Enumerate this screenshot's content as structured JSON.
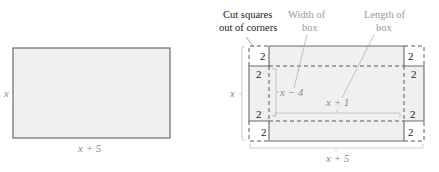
{
  "left_figure": {
    "height_label": "x",
    "width_label": "x + 5"
  },
  "right_figure": {
    "callouts": {
      "cut_squares_line1": "Cut squares",
      "cut_squares_line2": "out of corners",
      "width_line1": "Width of",
      "width_line2": "box",
      "length_line1": "Length of",
      "length_line2": "box"
    },
    "corner_labels": [
      "2",
      "2",
      "2",
      "2",
      "2",
      "2",
      "2",
      "2"
    ],
    "inner_width_label": "x − 4",
    "inner_length_label": "x + 1",
    "outer_height_label": "x",
    "outer_width_label": "x + 5"
  },
  "colors": {
    "sheet_fill": "#f0f0f0",
    "corner_fill": "#ffffff",
    "line": "#666666",
    "bracket": "#c8c8c8",
    "label_gray": "#9a9a9a"
  }
}
